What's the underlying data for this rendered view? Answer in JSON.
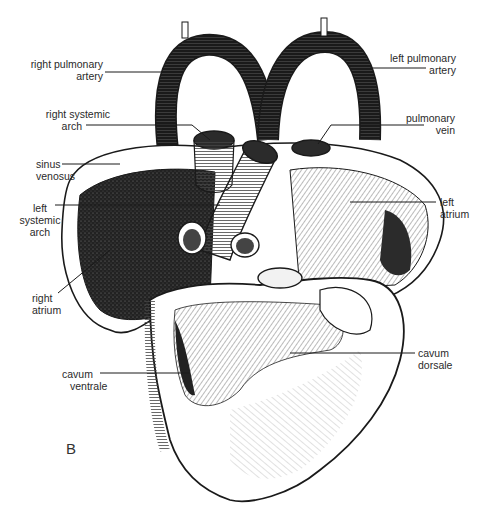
{
  "figure": {
    "panel_letter": "B",
    "labels": [
      {
        "id": "right-pulmonary-artery",
        "lines": [
          "right pulmonary",
          "artery"
        ]
      },
      {
        "id": "left-pulmonary-artery",
        "lines": [
          "left pulmonary",
          "artery"
        ]
      },
      {
        "id": "right-systemic-arch",
        "lines": [
          "right systemic",
          "arch"
        ]
      },
      {
        "id": "pulmonary-vein",
        "lines": [
          "pulmonary",
          "vein"
        ]
      },
      {
        "id": "sinus-venosus",
        "lines": [
          "sinus",
          "venosus"
        ]
      },
      {
        "id": "left-systemic-arch",
        "lines": [
          "left",
          "systemic",
          "arch"
        ]
      },
      {
        "id": "left-atrium",
        "lines": [
          "left",
          "atrium"
        ]
      },
      {
        "id": "right-atrium",
        "lines": [
          "right",
          "atrium"
        ]
      },
      {
        "id": "cavum-ventrale",
        "lines": [
          "cavum",
          "ventrale"
        ]
      },
      {
        "id": "cavum-dorsale",
        "lines": [
          "cavum",
          "dorsale"
        ]
      }
    ]
  },
  "colors": {
    "ink": "#1a1a1a",
    "paper": "#ffffff",
    "shade_dark": "#2b2b2b",
    "shade_mid": "#8a8a8a",
    "shade_light": "#d8d8d8"
  }
}
